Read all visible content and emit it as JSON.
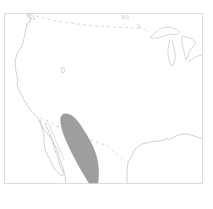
{
  "map": {
    "type": "range-map",
    "region": "Western United States and northern Mexico",
    "colors": {
      "background": "#ffffff",
      "outline": "#bdbdbd",
      "border_dashed": "#c4c4c4",
      "range_fill": "#9e9e9e",
      "frame": "#d6d6d6"
    },
    "layers": [
      {
        "name": "coastline",
        "style": "solid"
      },
      {
        "name": "international-border",
        "style": "dashed"
      },
      {
        "name": "great-lakes",
        "style": "solid"
      },
      {
        "name": "species-range",
        "style": "filled-gray"
      }
    ]
  }
}
